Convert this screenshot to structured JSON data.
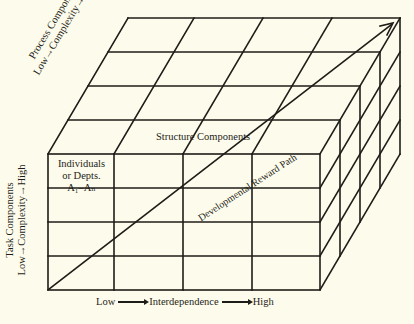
{
  "diagram": {
    "type": "3d-cube-matrix",
    "labels": {
      "process": {
        "title": "Process Components",
        "scale": "Low→Complexity→High"
      },
      "task": {
        "title": "Task Components",
        "scale": "Low→Complexity→High"
      },
      "structure": "Structure Components",
      "cell": {
        "line1": "Individuals",
        "line2": "or Depts.",
        "line3": "A₁–Aₙ"
      },
      "path": "Developmental Reward Path",
      "x_axis": {
        "low": "Low",
        "middle": "Interdependence",
        "high": "High"
      }
    },
    "grid": {
      "front_columns": 4,
      "front_rows": 4,
      "depth_layers": 4
    },
    "colors": {
      "background": "#fdfcec",
      "ink": "#1e1c18"
    }
  }
}
